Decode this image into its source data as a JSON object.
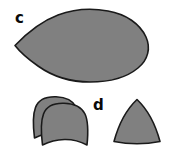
{
  "figure": {
    "width": 173,
    "height": 155,
    "background_color": "#ffffff",
    "shape_fill_color": "#808080",
    "shape_outline_color": "#1a1a1a",
    "label_color": "#0a0a0a",
    "panels": [
      {
        "id": "panel-c",
        "label": "c",
        "label_position": {
          "x": 15,
          "y": 11
        },
        "shape_name": "teardrop-outline",
        "description": "large gray teardrop / egg outline pointing left",
        "bounds": {
          "x": 14,
          "y": 9,
          "width": 134,
          "height": 73
        }
      },
      {
        "id": "panel-d",
        "label": "d",
        "label_position": {
          "x": 93,
          "y": 98
        },
        "shape_name": "reuleaux-triangle-outline",
        "description": "gray rounded triangle with apex up",
        "bounds": {
          "x": 113,
          "y": 99,
          "width": 48,
          "height": 45
        }
      }
    ],
    "unlabeled_shapes": [
      {
        "id": "dome-back",
        "shape_name": "dome-outline-back",
        "description": "gray arched dome with concave base, rear of overlapping pair",
        "bounds": {
          "x": 33,
          "y": 96,
          "width": 47,
          "height": 44
        }
      },
      {
        "id": "dome-front",
        "shape_name": "dome-outline-front",
        "description": "gray arched dome with concave base, front of overlapping pair",
        "bounds": {
          "x": 41,
          "y": 102,
          "width": 48,
          "height": 45
        }
      }
    ]
  }
}
